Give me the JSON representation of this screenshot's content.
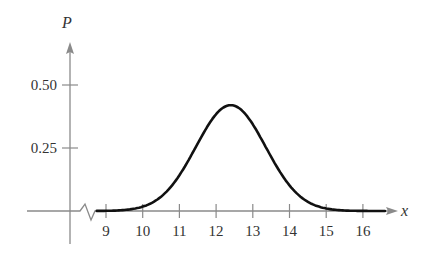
{
  "chart_data": {
    "type": "line",
    "title": "",
    "xlabel": "x",
    "ylabel": "P",
    "xlim": [
      9,
      16
    ],
    "ylim": [
      0,
      0.5
    ],
    "x_ticks": [
      9,
      10,
      11,
      12,
      13,
      14,
      15,
      16
    ],
    "x_tick_labels": [
      "9",
      "10",
      "11",
      "12",
      "13",
      "14",
      "15",
      "16"
    ],
    "y_ticks": [
      0.25,
      0.5
    ],
    "y_tick_labels": [
      "0.25",
      "0.50"
    ],
    "grid": false,
    "legend": null,
    "axis_break": "x-axis break (zigzag) between origin and 9",
    "distribution": {
      "mean": 12.4,
      "std": 0.95
    },
    "series": [
      {
        "name": "P(x)",
        "x": [
          8.7,
          9,
          9.5,
          10,
          10.5,
          11,
          11.5,
          12,
          12.4,
          12.8,
          13,
          13.5,
          14,
          14.5,
          15,
          15.5,
          16,
          16.6
        ],
        "values": [
          0.0,
          0.01,
          0.03,
          0.02,
          0.06,
          0.14,
          0.27,
          0.38,
          0.42,
          0.38,
          0.34,
          0.22,
          0.1,
          0.04,
          0.01,
          0.0,
          0.0,
          0.0
        ]
      }
    ],
    "colors": {
      "axis": "#8a8a8a",
      "curve": "#111111",
      "text": "#333333"
    }
  }
}
